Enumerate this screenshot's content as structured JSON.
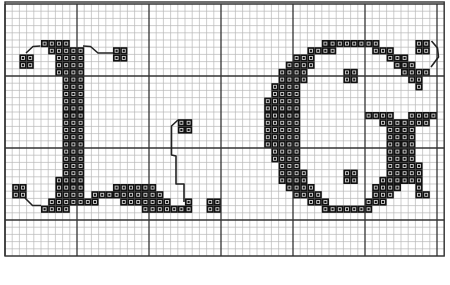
{
  "pattern": {
    "title": "Cross-stitch monogram L G",
    "letters": [
      "L",
      "G"
    ],
    "grid": {
      "origin_x": 5,
      "origin_y": 4,
      "cell": 7.2,
      "cols": 61,
      "rows": 35,
      "major_every": 10,
      "line_color": "#b8b8b8",
      "major_color": "#333333",
      "border_color": "#333333"
    },
    "stitch_color": "#111111",
    "stitch_inner_color": "#cfcfcf",
    "backstitch_color": "#222222",
    "filled_rows": [
      {
        "row": 5,
        "cols": [
          [
            5,
            8
          ],
          [
            44,
            51
          ],
          [
            57,
            58
          ]
        ]
      },
      {
        "row": 6,
        "cols": [
          [
            6,
            10
          ],
          [
            15,
            16
          ],
          [
            42,
            45
          ],
          [
            51,
            53
          ],
          [
            57,
            58
          ]
        ]
      },
      {
        "row": 7,
        "cols": [
          [
            2,
            3
          ],
          [
            7,
            10
          ],
          [
            15,
            16
          ],
          [
            40,
            42
          ],
          [
            53,
            55
          ]
        ]
      },
      {
        "row": 8,
        "cols": [
          [
            2,
            3
          ],
          [
            7,
            10
          ],
          [
            39,
            42
          ],
          [
            54,
            56
          ]
        ]
      },
      {
        "row": 9,
        "cols": [
          [
            7,
            10
          ],
          [
            38,
            41
          ],
          [
            47,
            48
          ],
          [
            55,
            58
          ]
        ]
      },
      {
        "row": 10,
        "cols": [
          [
            8,
            10
          ],
          [
            38,
            41
          ],
          [
            47,
            48
          ],
          [
            56,
            57
          ]
        ]
      },
      {
        "row": 11,
        "cols": [
          [
            8,
            10
          ],
          [
            37,
            40
          ],
          [
            57,
            57
          ]
        ]
      },
      {
        "row": 12,
        "cols": [
          [
            8,
            10
          ],
          [
            37,
            40
          ]
        ]
      },
      {
        "row": 13,
        "cols": [
          [
            8,
            10
          ],
          [
            36,
            40
          ]
        ]
      },
      {
        "row": 14,
        "cols": [
          [
            8,
            10
          ],
          [
            36,
            40
          ]
        ]
      },
      {
        "row": 15,
        "cols": [
          [
            8,
            10
          ],
          [
            36,
            40
          ],
          [
            50,
            53
          ],
          [
            56,
            59
          ]
        ]
      },
      {
        "row": 16,
        "cols": [
          [
            8,
            10
          ],
          [
            24,
            25
          ],
          [
            36,
            40
          ],
          [
            52,
            58
          ]
        ]
      },
      {
        "row": 17,
        "cols": [
          [
            8,
            10
          ],
          [
            24,
            25
          ],
          [
            36,
            40
          ],
          [
            53,
            56
          ]
        ]
      },
      {
        "row": 18,
        "cols": [
          [
            8,
            10
          ],
          [
            36,
            40
          ],
          [
            53,
            56
          ]
        ]
      },
      {
        "row": 19,
        "cols": [
          [
            8,
            10
          ],
          [
            36,
            40
          ],
          [
            53,
            56
          ]
        ]
      },
      {
        "row": 20,
        "cols": [
          [
            8,
            10
          ],
          [
            37,
            40
          ],
          [
            53,
            56
          ]
        ]
      },
      {
        "row": 21,
        "cols": [
          [
            8,
            10
          ],
          [
            37,
            40
          ],
          [
            53,
            56
          ]
        ]
      },
      {
        "row": 22,
        "cols": [
          [
            8,
            10
          ],
          [
            38,
            40
          ],
          [
            53,
            57
          ]
        ]
      },
      {
        "row": 23,
        "cols": [
          [
            8,
            10
          ],
          [
            38,
            41
          ],
          [
            47,
            48
          ],
          [
            53,
            57
          ]
        ]
      },
      {
        "row": 24,
        "cols": [
          [
            7,
            10
          ],
          [
            38,
            41
          ],
          [
            47,
            48
          ],
          [
            52,
            57
          ]
        ]
      },
      {
        "row": 25,
        "cols": [
          [
            1,
            2
          ],
          [
            7,
            10
          ],
          [
            15,
            20
          ],
          [
            39,
            42
          ],
          [
            51,
            54
          ],
          [
            57,
            57
          ]
        ]
      },
      {
        "row": 26,
        "cols": [
          [
            1,
            2
          ],
          [
            7,
            10
          ],
          [
            12,
            21
          ],
          [
            40,
            43
          ],
          [
            51,
            53
          ],
          [
            57,
            58
          ]
        ]
      },
      {
        "row": 27,
        "cols": [
          [
            6,
            12
          ],
          [
            16,
            22
          ],
          [
            25,
            25
          ],
          [
            28,
            29
          ],
          [
            42,
            44
          ],
          [
            50,
            52
          ]
        ]
      },
      {
        "row": 28,
        "cols": [
          [
            5,
            8
          ],
          [
            19,
            25
          ],
          [
            28,
            29
          ],
          [
            44,
            50
          ]
        ]
      }
    ],
    "backstitches": [
      [
        [
          26,
          53
        ],
        [
          33,
          46.5
        ],
        [
          40.5,
          46
        ]
      ],
      [
        [
          83,
          46
        ],
        [
          90.5,
          46.5
        ],
        [
          98,
          53
        ],
        [
          113,
          53
        ]
      ],
      [
        [
          25,
          198
        ],
        [
          32.5,
          205.5
        ],
        [
          41,
          205.5
        ]
      ],
      [
        [
          178,
          120
        ],
        [
          171.5,
          126
        ],
        [
          171.5,
          155
        ],
        [
          176,
          156
        ],
        [
          176,
          184
        ],
        [
          184,
          184
        ],
        [
          184,
          202
        ]
      ],
      [
        [
          431.5,
          41
        ],
        [
          437.5,
          48
        ],
        [
          438.5,
          57
        ],
        [
          431,
          67
        ]
      ]
    ]
  }
}
